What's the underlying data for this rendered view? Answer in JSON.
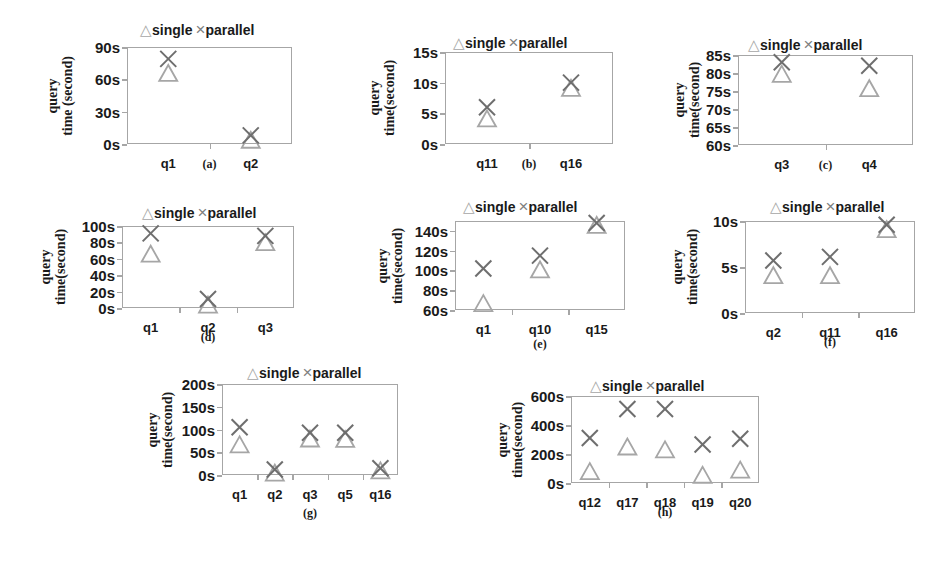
{
  "legend": {
    "single": "single",
    "parallel": "parallel",
    "single_marker": "triangle-icon",
    "parallel_marker": "cross-icon"
  },
  "ylabel": {
    "line1": "query",
    "line2_a": "time (second)",
    "line2": "time(second)"
  },
  "colors": {
    "single": "#a6a6a6",
    "parallel": "#6e6e6e",
    "frame": "#a6a6a6",
    "text": "#1a1a1a"
  },
  "chart_data": [
    {
      "type": "scatter",
      "id": "a",
      "caption": "(a)",
      "ylabel": "query time (second)",
      "categories": [
        "q1",
        "q2"
      ],
      "yticks": [
        "0s",
        "30s",
        "60s",
        "90s"
      ],
      "ylim": [
        0,
        90
      ],
      "series": [
        {
          "name": "single",
          "values": [
            65,
            3
          ]
        },
        {
          "name": "parallel",
          "values": [
            79,
            8
          ]
        }
      ]
    },
    {
      "type": "scatter",
      "id": "b",
      "caption": "(b)",
      "ylabel": "query time(second)",
      "categories": [
        "q11",
        "q16"
      ],
      "yticks": [
        "0s",
        "5s",
        "10s",
        "15s"
      ],
      "ylim": [
        0,
        15
      ],
      "series": [
        {
          "name": "single",
          "values": [
            4,
            9
          ]
        },
        {
          "name": "parallel",
          "values": [
            6,
            10
          ]
        }
      ]
    },
    {
      "type": "scatter",
      "id": "c",
      "caption": "(c)",
      "ylabel": "query time(second)",
      "categories": [
        "q3",
        "q4"
      ],
      "yticks": [
        "60s",
        "65s",
        "70s",
        "75s",
        "80s",
        "85s"
      ],
      "ylim": [
        60,
        85
      ],
      "series": [
        {
          "name": "single",
          "values": [
            79.5,
            75.5
          ]
        },
        {
          "name": "parallel",
          "values": [
            83,
            82
          ]
        }
      ]
    },
    {
      "type": "scatter",
      "id": "d",
      "caption": "(d)",
      "ylabel": "query time(second)",
      "categories": [
        "q1",
        "q2",
        "q3"
      ],
      "yticks": [
        "0s",
        "20s",
        "40s",
        "60s",
        "80s",
        "100s"
      ],
      "ylim": [
        0,
        100
      ],
      "series": [
        {
          "name": "single",
          "values": [
            65,
            3,
            79
          ]
        },
        {
          "name": "parallel",
          "values": [
            91,
            11,
            88
          ]
        }
      ]
    },
    {
      "type": "scatter",
      "id": "e",
      "caption": "(e)",
      "ylabel": "query time(second)",
      "categories": [
        "q1",
        "q10",
        "q15"
      ],
      "yticks": [
        "60s",
        "80s",
        "100s",
        "120s",
        "140s"
      ],
      "ylim": [
        60,
        150
      ],
      "series": [
        {
          "name": "single",
          "values": [
            66,
            100,
            145
          ]
        },
        {
          "name": "parallel",
          "values": [
            102,
            115,
            148
          ]
        }
      ]
    },
    {
      "type": "scatter",
      "id": "f",
      "caption": "(f)",
      "ylabel": "query time(second)",
      "categories": [
        "q2",
        "q11",
        "q16"
      ],
      "yticks": [
        "0s",
        "5s",
        "10s"
      ],
      "ylim": [
        0,
        10
      ],
      "series": [
        {
          "name": "single",
          "values": [
            4,
            4,
            9
          ]
        },
        {
          "name": "parallel",
          "values": [
            5.7,
            6.1,
            9.6
          ]
        }
      ]
    },
    {
      "type": "scatter",
      "id": "g",
      "caption": "(g)",
      "ylabel": "query time(second)",
      "categories": [
        "q1",
        "q2",
        "q3",
        "q5",
        "q16"
      ],
      "yticks": [
        "0s",
        "50s",
        "100s",
        "150s",
        "200s"
      ],
      "ylim": [
        0,
        200
      ],
      "series": [
        {
          "name": "single",
          "values": [
            65,
            3,
            78,
            77,
            8
          ]
        },
        {
          "name": "parallel",
          "values": [
            105,
            12,
            93,
            93,
            15
          ]
        }
      ]
    },
    {
      "type": "scatter",
      "id": "h",
      "caption": "(h)",
      "ylabel": "query time(second)",
      "categories": [
        "q12",
        "q17",
        "q18",
        "q19",
        "q20"
      ],
      "yticks": [
        "0s",
        "200s",
        "400s",
        "600s"
      ],
      "ylim": [
        0,
        600
      ],
      "series": [
        {
          "name": "single",
          "values": [
            75,
            245,
            225,
            50,
            85
          ]
        },
        {
          "name": "parallel",
          "values": [
            310,
            510,
            510,
            265,
            305
          ]
        }
      ]
    }
  ]
}
